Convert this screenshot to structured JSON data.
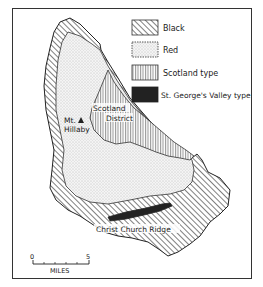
{
  "map": {
    "legend": [
      {
        "key": "black",
        "label": "Black",
        "pattern": "diagonal-hatch"
      },
      {
        "key": "red",
        "label": "Red",
        "pattern": "stipple"
      },
      {
        "key": "scotland",
        "label": "Scotland type",
        "pattern": "vertical-lines"
      },
      {
        "key": "st_george",
        "label": "St. George's Valley type",
        "pattern": "solid-dark"
      }
    ],
    "labels": {
      "mt_hillaby_line1": "Mt.",
      "mt_hillaby_line2": "Hillaby",
      "scotland_line1": "Scotland",
      "scotland_line2": "District",
      "christ_church": "Christ Church Ridge"
    },
    "scale": {
      "start": "0",
      "end": "5",
      "unit": "MILES"
    },
    "colors": {
      "ink": "#2a2a2a",
      "dark_fill": "#222222",
      "paper": "#ffffff",
      "stipple_bg": "#f2f2f2"
    }
  }
}
